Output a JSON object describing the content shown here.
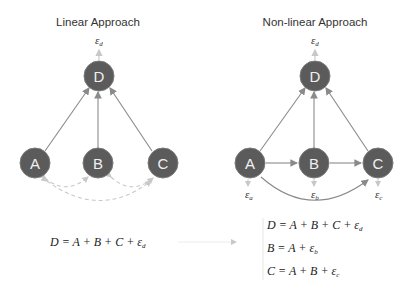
{
  "left": {
    "title": "Linear Approach",
    "nodes": {
      "D": "D",
      "A": "A",
      "B": "B",
      "C": "C"
    },
    "error_label": {
      "main": "ε",
      "sub": "d"
    },
    "equation": "D = A + B + C +  ε",
    "equation_sub": "d"
  },
  "right": {
    "title": "Non-linear Approach",
    "nodes": {
      "D": "D",
      "A": "A",
      "B": "B",
      "C": "C"
    },
    "error_labels": {
      "d": {
        "main": "ε",
        "sub": "d"
      },
      "a": {
        "main": "ε",
        "sub": "a"
      },
      "b": {
        "main": "ε",
        "sub": "b"
      },
      "c": {
        "main": "ε",
        "sub": "c"
      }
    },
    "equations": [
      {
        "text": "D = A + B + C +  ε",
        "sub": "d"
      },
      {
        "text": "B = A +  ε",
        "sub": "b"
      },
      {
        "text": "C = A + B + ε",
        "sub": "c"
      }
    ]
  },
  "colors": {
    "node_fill": "#5b5b5b",
    "node_stroke": "#7a7a7a",
    "edge": "#8a8a8a",
    "dashed": "#c8c8c8",
    "error_arrow": "#c8c8c8"
  }
}
